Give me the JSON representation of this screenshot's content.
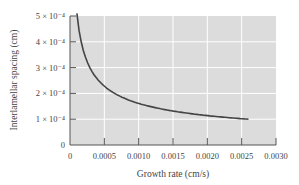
{
  "chart_data": {
    "type": "line",
    "title": "",
    "xlabel": "Growth rate (cm/s)",
    "ylabel": "Interlamellar spacing (cm)",
    "xlim": [
      0,
      0.003
    ],
    "ylim": [
      0,
      0.0005
    ],
    "grid": true,
    "legend": null,
    "x_ticks": [
      "0",
      "0.0005",
      "0.0010",
      "0.0015",
      "0.0020",
      "0.0025",
      "0.0030"
    ],
    "y_ticks": [
      "0",
      "1 × 10⁻⁴",
      "2 × 10⁻⁴",
      "3 × 10⁻⁴",
      "4 × 10⁻⁴",
      "5 × 10⁻⁴"
    ],
    "series": [
      {
        "name": "spacing vs growth rate",
        "color": "#444444",
        "x": [
          0.0001,
          0.0002,
          0.0003,
          0.0005,
          0.0007,
          0.001,
          0.0013,
          0.0015,
          0.0018,
          0.002,
          0.0023,
          0.0026
        ],
        "y": [
          0.00042,
          0.00033,
          0.000275,
          0.000215,
          0.00018,
          0.000155,
          0.000135,
          0.000127,
          0.000117,
          0.000112,
          0.000106,
          0.0001
        ]
      }
    ],
    "colors": {
      "plot_background": "#dcdcdc",
      "grid": "#ffffff",
      "axes": "#555555"
    }
  }
}
